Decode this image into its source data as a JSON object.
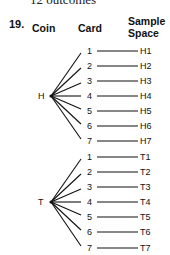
{
  "top_text": "12 outcomes",
  "problem_number": "19.",
  "headers": {
    "coin": "Coin",
    "card": "Card",
    "sample_space_line1": "Sample",
    "sample_space_line2": "Space"
  },
  "tree": {
    "coin_nodes": [
      {
        "label": "H",
        "y": 96,
        "cards": [
          "1",
          "2",
          "3",
          "4",
          "5",
          "6",
          "7"
        ],
        "outcomes": [
          "H1",
          "H2",
          "H3",
          "H4",
          "H5",
          "H6",
          "H7"
        ],
        "card_ys": [
          51,
          66,
          81,
          96,
          111,
          126,
          141
        ]
      },
      {
        "label": "T",
        "y": 202,
        "cards": [
          "1",
          "2",
          "3",
          "4",
          "5",
          "6",
          "7"
        ],
        "outcomes": [
          "T1",
          "T2",
          "T3",
          "T4",
          "T5",
          "T6",
          "T7"
        ],
        "card_ys": [
          157,
          172,
          187,
          202,
          217,
          232,
          248
        ]
      }
    ]
  }
}
